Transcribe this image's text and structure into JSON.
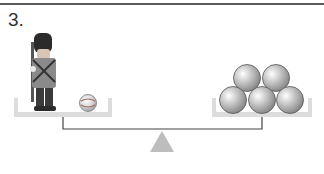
{
  "question": {
    "number_label": "3."
  },
  "scene": {
    "left_pan": {
      "items": [
        "toy-soldier",
        "marble"
      ]
    },
    "right_pan": {
      "items": [
        "metal-ball",
        "metal-ball",
        "metal-ball",
        "metal-ball",
        "metal-ball"
      ],
      "ball_count": 5
    },
    "colors": {
      "pan": "#dcdcdc",
      "beam": "#444444",
      "fulcrum": "#bdbdbd",
      "ball": "#b8b8b8",
      "soldier_hat": "#2b2b2b",
      "soldier_coat": "#8a8a8a"
    }
  }
}
